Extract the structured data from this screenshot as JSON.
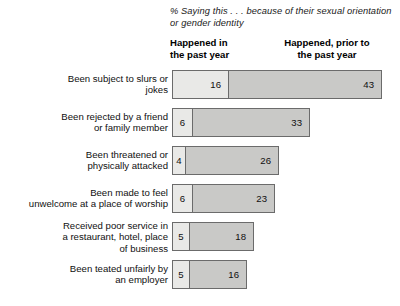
{
  "header": {
    "subtitle": "% Saying this . . . because of their sexual orientation or gender identity",
    "col_recent_line1": "Happened in",
    "col_recent_line2": "the past year",
    "col_prior_line1": "Happened, prior to",
    "col_prior_line2": "the past year"
  },
  "colors": {
    "recent": "#E9E9E7",
    "prior": "#C9C9C7",
    "border": "#6B6B6B",
    "text": "#101010",
    "background": "#FFFFFF"
  },
  "chart_data": {
    "type": "bar",
    "title": "",
    "subtitle": "% Saying this . . . because of their sexual orientation or gender identity",
    "xlabel": "",
    "ylabel": "",
    "orientation": "horizontal",
    "stacked": true,
    "grid": false,
    "legend_position": "top",
    "xlim": [
      0,
      59
    ],
    "categories": [
      "Been subject to slurs or jokes",
      "Been rejected by a friend or family member",
      "Been threatened or physically attacked",
      "Been made to feel unwelcome at a place of worship",
      "Received poor service in a restaurant, hotel, place of business",
      "Been teated unfairly by an employer"
    ],
    "series": [
      {
        "name": "Happened in the past year",
        "values": [
          16,
          6,
          4,
          6,
          5,
          5
        ]
      },
      {
        "name": "Happened, prior to the past year",
        "values": [
          43,
          33,
          26,
          23,
          18,
          16
        ]
      }
    ]
  },
  "rows": [
    {
      "label_lines": [
        "Been subject to slurs or",
        "jokes"
      ],
      "recent": 16,
      "prior": 43
    },
    {
      "label_lines": [
        "Been rejected by a friend",
        "or family member"
      ],
      "recent": 6,
      "prior": 33
    },
    {
      "label_lines": [
        "Been threatened or",
        "physically attacked"
      ],
      "recent": 4,
      "prior": 26
    },
    {
      "label_lines": [
        "Been made to feel",
        "unwelcome at a place of worship"
      ],
      "recent": 6,
      "prior": 23
    },
    {
      "label_lines": [
        "Received poor service in",
        "a restaurant, hotel, place",
        "of business"
      ],
      "recent": 5,
      "prior": 18
    },
    {
      "label_lines": [
        "Been teated unfairly by",
        "an employer"
      ],
      "recent": 5,
      "prior": 16
    }
  ]
}
